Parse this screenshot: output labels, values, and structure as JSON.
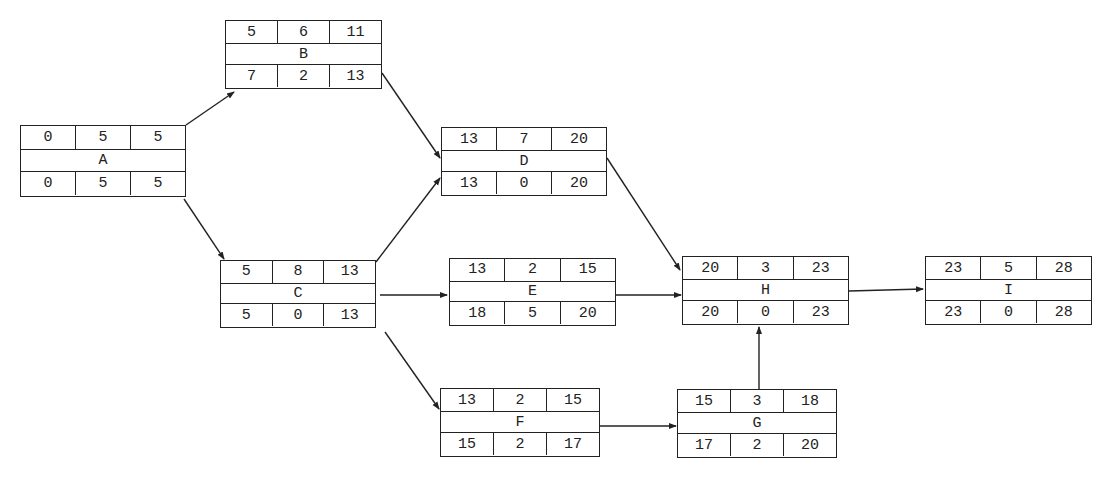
{
  "diagram": {
    "type": "activity-on-node network (critical path method)",
    "node_layout": "top row: ES | Duration | EF; middle: activity name; bottom row: LS | Total Float | LF",
    "nodes": [
      {
        "id": "A",
        "x": 20,
        "y": 125,
        "w": 166,
        "h": 72,
        "top": [
          "0",
          "5",
          "5"
        ],
        "name": "A",
        "bottom": [
          "0",
          "5",
          "5"
        ]
      },
      {
        "id": "B",
        "x": 225,
        "y": 20,
        "w": 157,
        "h": 69,
        "top": [
          "5",
          "6",
          "11"
        ],
        "name": "B",
        "bottom": [
          "7",
          "2",
          "13"
        ]
      },
      {
        "id": "C",
        "x": 220,
        "y": 260,
        "w": 156,
        "h": 68,
        "top": [
          "5",
          "8",
          "13"
        ],
        "name": "C",
        "bottom": [
          "5",
          "0",
          "13"
        ]
      },
      {
        "id": "D",
        "x": 441,
        "y": 127,
        "w": 166,
        "h": 69,
        "top": [
          "13",
          "7",
          "20"
        ],
        "name": "D",
        "bottom": [
          "13",
          "0",
          "20"
        ]
      },
      {
        "id": "E",
        "x": 449,
        "y": 258,
        "w": 167,
        "h": 68,
        "top": [
          "13",
          "2",
          "15"
        ],
        "name": "E",
        "bottom": [
          "18",
          "5",
          "20"
        ]
      },
      {
        "id": "F",
        "x": 440,
        "y": 388,
        "w": 160,
        "h": 69,
        "top": [
          "13",
          "2",
          "15"
        ],
        "name": "F",
        "bottom": [
          "15",
          "2",
          "17"
        ]
      },
      {
        "id": "G",
        "x": 677,
        "y": 389,
        "w": 160,
        "h": 69,
        "top": [
          "15",
          "3",
          "18"
        ],
        "name": "G",
        "bottom": [
          "17",
          "2",
          "20"
        ]
      },
      {
        "id": "H",
        "x": 682,
        "y": 256,
        "w": 167,
        "h": 69,
        "top": [
          "20",
          "3",
          "23"
        ],
        "name": "H",
        "bottom": [
          "20",
          "0",
          "23"
        ]
      },
      {
        "id": "I",
        "x": 925,
        "y": 256,
        "w": 167,
        "h": 69,
        "top": [
          "23",
          "5",
          "28"
        ],
        "name": "I",
        "bottom": [
          "23",
          "0",
          "28"
        ]
      }
    ],
    "edges": [
      {
        "from": "A",
        "to": "B",
        "x1": 186,
        "y1": 125,
        "x2": 234,
        "y2": 92
      },
      {
        "from": "A",
        "to": "C",
        "x1": 184,
        "y1": 199,
        "x2": 224,
        "y2": 259
      },
      {
        "from": "B",
        "to": "D",
        "x1": 382,
        "y1": 73,
        "x2": 440,
        "y2": 158
      },
      {
        "from": "C",
        "to": "D",
        "x1": 376,
        "y1": 262,
        "x2": 440,
        "y2": 178
      },
      {
        "from": "C",
        "to": "E",
        "x1": 380,
        "y1": 295,
        "x2": 447,
        "y2": 295
      },
      {
        "from": "C",
        "to": "F",
        "x1": 385,
        "y1": 332,
        "x2": 439,
        "y2": 409
      },
      {
        "from": "D",
        "to": "H",
        "x1": 607,
        "y1": 158,
        "x2": 680,
        "y2": 270
      },
      {
        "from": "E",
        "to": "H",
        "x1": 616,
        "y1": 295,
        "x2": 681,
        "y2": 295
      },
      {
        "from": "F",
        "to": "G",
        "x1": 600,
        "y1": 426,
        "x2": 676,
        "y2": 426
      },
      {
        "from": "G",
        "to": "H",
        "x1": 759,
        "y1": 412,
        "x2": 759,
        "y2": 327
      },
      {
        "from": "H",
        "to": "I",
        "x1": 849,
        "y1": 291,
        "x2": 923,
        "y2": 289
      }
    ],
    "colors": {
      "line": "#222222",
      "background": "#ffffff"
    }
  }
}
